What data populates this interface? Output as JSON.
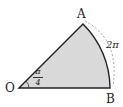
{
  "diagram": {
    "type": "circular-sector",
    "points": {
      "O": "O",
      "A": "A",
      "B": "B"
    },
    "angle_label": {
      "numerator": "π",
      "denominator": "4"
    },
    "arc_label": "2π",
    "colors": {
      "fill": "#d9d9d9",
      "stroke": "#222222",
      "dashed": "#999999"
    }
  }
}
